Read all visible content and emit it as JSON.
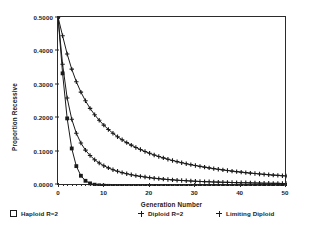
{
  "chart_data": {
    "type": "line",
    "title": "",
    "xlabel": "Generation Number",
    "ylabel": "Proportion Recessive",
    "xlim": [
      0,
      50
    ],
    "ylim": [
      0.0,
      0.5
    ],
    "xticks": [
      0,
      10,
      20,
      30,
      40,
      50
    ],
    "xtick_labels": [
      "0",
      "10",
      "20",
      "30",
      "40",
      "50"
    ],
    "yticks": [
      0.0,
      0.1,
      0.2,
      0.3,
      0.4,
      0.5
    ],
    "ytick_labels": [
      "0.0000",
      "0.1000",
      "0.2000",
      "0.3000",
      "0.4000",
      "0.5000"
    ],
    "grid": false,
    "legend_position": "below",
    "x": [
      0,
      1,
      2,
      3,
      4,
      5,
      6,
      7,
      8,
      9,
      10,
      11,
      12,
      13,
      14,
      15,
      16,
      17,
      18,
      19,
      20,
      21,
      22,
      23,
      24,
      25,
      26,
      27,
      28,
      29,
      30,
      31,
      32,
      33,
      34,
      35,
      36,
      37,
      38,
      39,
      40,
      41,
      42,
      43,
      44,
      45,
      46,
      47,
      48,
      49,
      50
    ],
    "series": [
      {
        "name": "Haploid R=2",
        "marker": "filled-square",
        "values": [
          0.5,
          0.3333,
          0.2,
          0.1111,
          0.0588,
          0.0303,
          0.0154,
          0.0078,
          0.0039,
          0.002,
          0.001,
          0.0005,
          0.0002,
          0.0001,
          0.0001,
          0.0,
          0.0,
          0.0,
          0.0,
          0.0,
          0.0,
          0.0,
          0.0,
          0.0,
          0.0,
          0.0,
          0.0,
          0.0,
          0.0,
          0.0,
          0.0,
          0.0,
          0.0,
          0.0,
          0.0,
          0.0,
          0.0,
          0.0,
          0.0,
          0.0,
          0.0,
          0.0,
          0.0,
          0.0,
          0.0,
          0.0,
          0.0,
          0.0,
          0.0,
          0.0,
          0.0
        ]
      },
      {
        "name": "Diploid R=2",
        "marker": "plus",
        "values": [
          0.5,
          0.36,
          0.2603,
          0.1975,
          0.156,
          0.1271,
          0.106,
          0.0901,
          0.0778,
          0.068,
          0.0601,
          0.0536,
          0.0481,
          0.0435,
          0.0396,
          0.0362,
          0.0333,
          0.0307,
          0.0285,
          0.0265,
          0.0247,
          0.0231,
          0.0217,
          0.0204,
          0.0192,
          0.0182,
          0.0172,
          0.0164,
          0.0156,
          0.0148,
          0.0141,
          0.0135,
          0.013,
          0.0124,
          0.0119,
          0.0115,
          0.0111,
          0.0107,
          0.0103,
          0.01,
          0.0097,
          0.0094,
          0.0091,
          0.0088,
          0.0086,
          0.0083,
          0.0081,
          0.0079,
          0.0077,
          0.0075,
          0.0073
        ]
      },
      {
        "name": "Limiting Diploid",
        "marker": "plus",
        "values": [
          0.5,
          0.4444,
          0.3906,
          0.3457,
          0.3086,
          0.2778,
          0.252,
          0.2298,
          0.2109,
          0.1944,
          0.18,
          0.1673,
          0.156,
          0.1458,
          0.1367,
          0.1284,
          0.1209,
          0.1141,
          0.1078,
          0.102,
          0.0967,
          0.0918,
          0.0873,
          0.0831,
          0.0791,
          0.0755,
          0.0721,
          0.0689,
          0.0659,
          0.0631,
          0.0605,
          0.058,
          0.0557,
          0.0535,
          0.0514,
          0.0494,
          0.0476,
          0.0458,
          0.0441,
          0.0425,
          0.041,
          0.0396,
          0.0382,
          0.0369,
          0.0357,
          0.0345,
          0.0334,
          0.0323,
          0.0313,
          0.0303,
          0.0294
        ]
      }
    ]
  },
  "legend": {
    "items": [
      {
        "label": "Haploid R=2",
        "marker": "open-square"
      },
      {
        "label": "Diploid R=2",
        "marker": "plus"
      },
      {
        "label": "Limiting Diploid",
        "marker": "plus"
      }
    ]
  },
  "colors": {
    "ink": "#1a1a1a",
    "axis": "#2b2b2b",
    "background": "#ffffff"
  }
}
